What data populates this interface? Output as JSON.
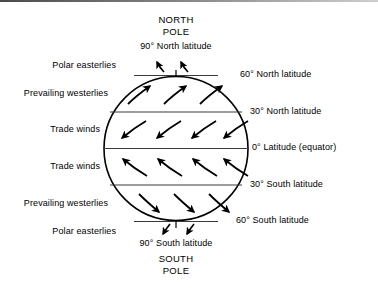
{
  "figure": {
    "kind": "global-wind-belts-diagram",
    "poles": {
      "north": "NORTH\nPOLE",
      "south": "SOUTH\nPOLE"
    },
    "latitude_labels": [
      {
        "id": "lat-90n",
        "text": "90° North latitude",
        "side": "top"
      },
      {
        "id": "lat-60n",
        "text": "60° North latitude",
        "side": "right"
      },
      {
        "id": "lat-30n",
        "text": "30° North latitude",
        "side": "right"
      },
      {
        "id": "lat-0",
        "text": "0° Latitude (equator)",
        "side": "right"
      },
      {
        "id": "lat-30s",
        "text": "30° South latitude",
        "side": "right"
      },
      {
        "id": "lat-60s",
        "text": "60° South latitude",
        "side": "right"
      },
      {
        "id": "lat-90s",
        "text": "90° South latitude",
        "side": "bottom"
      }
    ],
    "wind_belt_labels": [
      {
        "id": "belt-polar-easterlies-n",
        "text": "Polar easterlies",
        "hemisphere": "north"
      },
      {
        "id": "belt-prevailing-westerlies-n",
        "text": "Prevailing westerlies",
        "hemisphere": "north"
      },
      {
        "id": "belt-trade-winds-n",
        "text": "Trade winds",
        "hemisphere": "north"
      },
      {
        "id": "belt-trade-winds-s",
        "text": "Trade winds",
        "hemisphere": "south"
      },
      {
        "id": "belt-prevailing-westerlies-s",
        "text": "Prevailing westerlies",
        "hemisphere": "south"
      },
      {
        "id": "belt-polar-easterlies-s",
        "text": "Polar easterlies",
        "hemisphere": "south"
      }
    ],
    "colors": {
      "stroke": "#000000",
      "background": "#ffffff",
      "text": "#000000",
      "band_line": "#3a3a3a"
    }
  }
}
